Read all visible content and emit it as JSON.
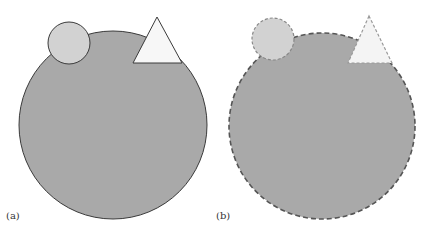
{
  "figure": {
    "panels": [
      {
        "id": "a",
        "label": "(a)",
        "style": "solid-outline",
        "large_circle": {
          "cx": 113,
          "cy": 125,
          "r": 94
        },
        "small_circle": {
          "cx": 69,
          "cy": 43,
          "r": 21
        },
        "triangle": {
          "points": "157,17 133,63 182,63"
        }
      },
      {
        "id": "b",
        "label": "(b)",
        "style": "dashed-blurred-outline",
        "large_circle": {
          "cx": 322,
          "cy": 126,
          "r": 93
        },
        "small_circle": {
          "cx": 273,
          "cy": 39,
          "r": 21
        },
        "triangle": {
          "points": "369,16 348,63 392,63"
        }
      }
    ],
    "colors": {
      "large_fill": "#a9a9a9",
      "small_circle_fill": "#d2d2d2",
      "triangle_fill": "#f7f7f7",
      "outline": "#3a3a3a"
    }
  }
}
